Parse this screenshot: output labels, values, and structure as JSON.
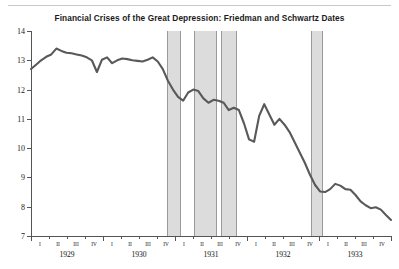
{
  "chart_data": {
    "type": "line",
    "title": "Financial Crises of the Great Depression: Friedman and Schwartz Dates",
    "xlabel": "",
    "ylabel": "",
    "ylim": [
      7,
      14
    ],
    "yticks": [
      7,
      8,
      9,
      10,
      11,
      12,
      13,
      14
    ],
    "grid": false,
    "legend": "none",
    "line_color": "#595959",
    "band_color": "#dcdcdc",
    "band_border_color": "#9a9a9a",
    "years": [
      "1929",
      "1930",
      "1931",
      "1932",
      "1933"
    ],
    "quarters": [
      "I",
      "II",
      "III",
      "IV"
    ],
    "x_tick_labels": [
      "I",
      "II",
      "III",
      "IV",
      "I",
      "II",
      "III",
      "IV",
      "I",
      "II",
      "III",
      "IV",
      "I",
      "II",
      "III",
      "IV",
      "I",
      "II",
      "III",
      "IV"
    ],
    "crisis_bands": [
      {
        "label": "1930-IV",
        "start": 7.55,
        "end": 8.35
      },
      {
        "label": "1931-II/III",
        "start": 9.05,
        "end": 10.35
      },
      {
        "label": "1931-III/IV",
        "start": 10.55,
        "end": 11.45
      },
      {
        "label": "1933-I",
        "start": 15.55,
        "end": 16.25
      }
    ],
    "x": [
      0.0,
      0.33,
      0.66,
      1.0,
      1.33,
      1.66,
      2.0,
      2.33,
      2.66,
      3.0,
      3.33,
      3.66,
      4.0,
      4.33,
      4.66,
      5.0,
      5.33,
      5.66,
      6.0,
      6.33,
      6.66,
      7.0,
      7.33,
      7.66,
      8.0,
      8.33,
      8.66,
      9.0,
      9.33,
      9.66,
      10.0,
      10.33,
      10.66,
      11.0,
      11.33,
      11.66,
      12.0,
      12.33,
      12.66,
      13.0,
      13.33,
      13.66,
      14.0,
      14.33,
      14.66,
      15.0,
      15.33,
      15.66,
      16.0,
      16.33,
      16.66,
      17.0,
      17.33,
      17.66,
      18.0,
      18.33,
      18.66,
      19.0,
      19.33,
      19.66
    ],
    "values": [
      12.7,
      12.85,
      13.0,
      13.12,
      13.2,
      13.4,
      13.32,
      13.26,
      13.24,
      13.2,
      13.16,
      13.1,
      13.0,
      12.6,
      13.02,
      13.1,
      12.9,
      13.0,
      13.06,
      13.04,
      13.0,
      12.98,
      12.96,
      13.02,
      13.1,
      12.96,
      12.7,
      12.3,
      12.0,
      11.75,
      11.62,
      11.9,
      12.0,
      11.95,
      11.7,
      11.55,
      11.65,
      11.62,
      11.55,
      11.3,
      11.38,
      11.3,
      10.85,
      10.3,
      10.22,
      11.1,
      11.5,
      11.15,
      10.8,
      11.0,
      10.8,
      10.55,
      10.2,
      9.85,
      9.5,
      9.1,
      8.75,
      8.52,
      8.5,
      8.6
    ],
    "values_tail": [
      8.78,
      8.72,
      8.6,
      8.58,
      8.4,
      8.18,
      8.05,
      7.95,
      7.98,
      7.9,
      7.72,
      7.55
    ]
  }
}
